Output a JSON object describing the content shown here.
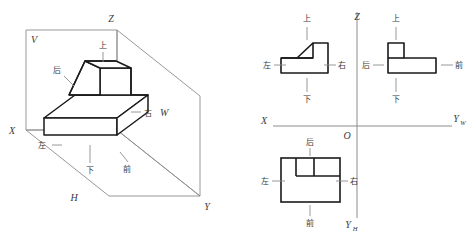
{
  "figure": {
    "colors": {
      "object_stroke": "#1a1a1a",
      "frame_stroke": "#8c8c8c",
      "leader_stroke": "#8c8c8c",
      "axis_stroke": "#8c8c8c",
      "text": "#3a3a3a",
      "background": "#ffffff"
    },
    "left_panel": {
      "name": "三投影面体系轴测图",
      "plane_labels": [
        {
          "id": "V",
          "text": "V",
          "x": 34,
          "y": 39
        },
        {
          "id": "H",
          "text": "H",
          "x": 74,
          "y": 197
        },
        {
          "id": "W",
          "text": "W",
          "x": 158,
          "y": 113
        }
      ],
      "axis_labels": [
        {
          "id": "Z",
          "text": "Z",
          "x": 111,
          "y": 18
        },
        {
          "id": "X",
          "text": "X",
          "x": 9,
          "y": 131
        },
        {
          "id": "Y",
          "text": "Y",
          "x": 207,
          "y": 206
        }
      ],
      "direction_labels": [
        {
          "id": "up",
          "text": "上",
          "x": 96,
          "y": 47
        },
        {
          "id": "back",
          "text": "后",
          "x": 57,
          "y": 71
        },
        {
          "id": "right",
          "text": "右",
          "x": 146,
          "y": 113
        },
        {
          "id": "left",
          "text": "左",
          "x": 42,
          "y": 147
        },
        {
          "id": "down",
          "text": "下",
          "x": 87,
          "y": 176
        },
        {
          "id": "front",
          "text": "前",
          "x": 122,
          "y": 172
        }
      ]
    },
    "right_panel": {
      "name": "三视图（六向标注）",
      "axis_labels": [
        {
          "id": "Z",
          "text": "Z",
          "x": 353,
          "y": 18
        },
        {
          "id": "X",
          "text": "X",
          "x": 262,
          "y": 126
        },
        {
          "id": "O",
          "text": "O",
          "x": 347,
          "y": 138
        },
        {
          "id": "Yw",
          "text": "Y",
          "sub": "W",
          "x": 455,
          "y": 126
        },
        {
          "id": "Yh",
          "text": "Y",
          "sub": "H",
          "x": 347,
          "y": 228
        }
      ],
      "views": [
        {
          "id": "front-view",
          "name": "主视图",
          "labels": [
            {
              "id": "up",
              "text": "上"
            },
            {
              "id": "left",
              "text": "左"
            },
            {
              "id": "right",
              "text": "右"
            },
            {
              "id": "down",
              "text": "下"
            }
          ]
        },
        {
          "id": "side-view",
          "name": "左视图",
          "labels": [
            {
              "id": "up",
              "text": "上"
            },
            {
              "id": "back",
              "text": "后"
            },
            {
              "id": "front",
              "text": "前"
            },
            {
              "id": "down",
              "text": "下"
            }
          ]
        },
        {
          "id": "top-view",
          "name": "俯视图",
          "labels": [
            {
              "id": "back",
              "text": "后"
            },
            {
              "id": "left",
              "text": "左"
            },
            {
              "id": "right",
              "text": "右"
            },
            {
              "id": "front",
              "text": "前"
            }
          ]
        }
      ],
      "direction_labels": [
        {
          "id": "fv-up",
          "text": "上",
          "x": 306,
          "y": 18
        },
        {
          "id": "fv-left",
          "text": "左",
          "x": 267,
          "y": 65
        },
        {
          "id": "fv-right",
          "text": "右",
          "x": 338,
          "y": 65
        },
        {
          "id": "fv-down",
          "text": "下",
          "x": 306,
          "y": 100
        },
        {
          "id": "sv-up",
          "text": "上",
          "x": 406,
          "y": 18
        },
        {
          "id": "sv-back",
          "text": "后",
          "x": 366,
          "y": 65
        },
        {
          "id": "sv-front",
          "text": "前",
          "x": 448,
          "y": 65
        },
        {
          "id": "sv-down",
          "text": "下",
          "x": 406,
          "y": 100
        },
        {
          "id": "tv-back",
          "text": "后",
          "x": 310,
          "y": 145
        },
        {
          "id": "tv-left",
          "text": "左",
          "x": 263,
          "y": 183
        },
        {
          "id": "tv-right",
          "text": "右",
          "x": 343,
          "y": 183
        },
        {
          "id": "tv-front",
          "text": "前",
          "x": 310,
          "y": 223
        }
      ]
    }
  }
}
